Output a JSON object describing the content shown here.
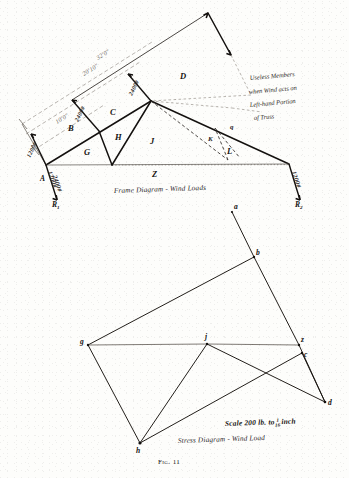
{
  "figure": {
    "number_label": "Fig. 11",
    "upper_caption": "Frame Diagram - Wind Loads",
    "lower_caption": "Stress Diagram - Wind Load",
    "scale_prefix": "Scale  200 lb. to",
    "scale_fraction_numerator": "1",
    "scale_fraction_denominator": "16",
    "scale_suffix": "inch"
  },
  "frame_diagram": {
    "note_lines": [
      "Useless Members",
      "when Wind acts on",
      "Left-hand Portion",
      "of Truss"
    ],
    "dimensions": [
      {
        "id": "span-overall",
        "value": "32'0\""
      },
      {
        "id": "rafter-length",
        "value": "20'10\""
      },
      {
        "id": "panel-length",
        "value": "10'0\""
      }
    ],
    "wind_loads": [
      {
        "id": "load-lower-left",
        "value": "1200#"
      },
      {
        "id": "load-mid-rafter",
        "value": "2400#"
      },
      {
        "id": "load-apex",
        "value": "2400#"
      }
    ],
    "reactions": [
      {
        "id": "reaction-left",
        "support": "R",
        "subscript": "1",
        "value": "2400#",
        "secondary": "1200#"
      },
      {
        "id": "reaction-right",
        "support": "R",
        "subscript": "2",
        "value": "1200#"
      }
    ],
    "joint_labels": [
      {
        "id": "joint-a",
        "text": "A"
      }
    ],
    "panel_labels": [
      {
        "id": "panel-b",
        "text": "B"
      },
      {
        "id": "panel-c",
        "text": "C"
      },
      {
        "id": "panel-d",
        "text": "D"
      },
      {
        "id": "panel-g",
        "text": "G"
      },
      {
        "id": "panel-h",
        "text": "H"
      },
      {
        "id": "panel-j",
        "text": "J"
      },
      {
        "id": "panel-k",
        "text": "K"
      },
      {
        "id": "panel-l",
        "text": "L"
      },
      {
        "id": "panel-q",
        "text": "q"
      },
      {
        "id": "panel-z",
        "text": "Z"
      }
    ]
  },
  "stress_diagram": {
    "point_labels": [
      {
        "id": "pt-a",
        "text": "a"
      },
      {
        "id": "pt-b",
        "text": "b"
      },
      {
        "id": "pt-c",
        "text": "c"
      },
      {
        "id": "pt-d",
        "text": "d"
      },
      {
        "id": "pt-g",
        "text": "g"
      },
      {
        "id": "pt-h",
        "text": "h"
      },
      {
        "id": "pt-j",
        "text": "j"
      },
      {
        "id": "pt-z",
        "text": "z"
      }
    ]
  },
  "colors": {
    "ink": "#14110f",
    "faint_ink": "#8b857d",
    "paper": "#fdfdfb"
  }
}
